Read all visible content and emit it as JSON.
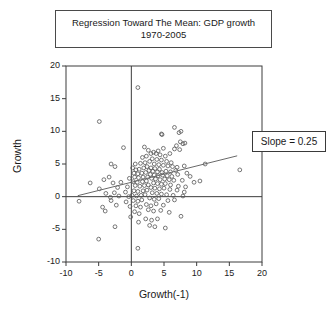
{
  "title": {
    "line1": "Regression Toward The Mean: GDP growth",
    "line2": "1970-2005"
  },
  "annotation": {
    "slope_label": "Slope = 0.25"
  },
  "axis": {
    "xlabel": "Growth(-1)",
    "ylabel": "Growth",
    "xticks": [
      "-10",
      "-5",
      "0",
      "5",
      "10",
      "15",
      "20"
    ],
    "yticks": [
      "20",
      "15",
      "10",
      "5",
      "0",
      "-5",
      "-10"
    ]
  },
  "chart_data": {
    "type": "scatter",
    "title": "Regression Toward The Mean: GDP growth 1970-2005",
    "xlabel": "Growth(-1)",
    "ylabel": "Growth",
    "xlim": [
      -10,
      20
    ],
    "ylim": [
      -10,
      20
    ],
    "xticks": [
      -10,
      -5,
      0,
      5,
      10,
      15,
      20
    ],
    "yticks": [
      -10,
      -5,
      0,
      5,
      10,
      15,
      20
    ],
    "grid": false,
    "legend": null,
    "marker": "open-circle",
    "marker_color": "#555555",
    "reference_lines": [
      {
        "name": "x-zero-line",
        "type": "vertical",
        "value": 0
      },
      {
        "name": "y-zero-line",
        "type": "horizontal",
        "value": 0
      }
    ],
    "fit_line": {
      "name": "regression-line",
      "slope": 0.25,
      "intercept": 2.2,
      "x_start": -8.2,
      "x_end": 16.2,
      "label": "Slope = 0.25"
    },
    "points": [
      [
        1.0,
        16.7
      ],
      [
        -4.9,
        11.5
      ],
      [
        6.6,
        10.6
      ],
      [
        7.6,
        10.0
      ],
      [
        4.6,
        9.6
      ],
      [
        4.7,
        9.5
      ],
      [
        7.3,
        9.8
      ],
      [
        7.5,
        8.4
      ],
      [
        8.2,
        8.2
      ],
      [
        7.9,
        8.1
      ],
      [
        6.9,
        7.8
      ],
      [
        7.4,
        7.2
      ],
      [
        6.6,
        7.3
      ],
      [
        4.9,
        7.4
      ],
      [
        4.1,
        7.0
      ],
      [
        2.6,
        7.1
      ],
      [
        2.0,
        7.6
      ],
      [
        -1.2,
        7.5
      ],
      [
        3.0,
        6.6
      ],
      [
        3.4,
        6.8
      ],
      [
        3.8,
        6.6
      ],
      [
        4.4,
        6.4
      ],
      [
        5.2,
        6.2
      ],
      [
        5.9,
        6.6
      ],
      [
        2.3,
        6.2
      ],
      [
        1.7,
        6.0
      ],
      [
        3.2,
        5.8
      ],
      [
        3.9,
        5.7
      ],
      [
        4.6,
        5.6
      ],
      [
        5.4,
        5.4
      ],
      [
        6.1,
        5.2
      ],
      [
        2.8,
        5.4
      ],
      [
        2.1,
        5.2
      ],
      [
        1.4,
        5.1
      ],
      [
        0.6,
        5.0
      ],
      [
        -3.1,
        5.0
      ],
      [
        -2.5,
        4.6
      ],
      [
        3.5,
        5.0
      ],
      [
        4.2,
        4.9
      ],
      [
        4.9,
        4.8
      ],
      [
        5.6,
        4.7
      ],
      [
        6.3,
        4.6
      ],
      [
        7.0,
        4.5
      ],
      [
        8.1,
        4.7
      ],
      [
        11.3,
        5.0
      ],
      [
        16.6,
        4.1
      ],
      [
        2.4,
        4.6
      ],
      [
        3.0,
        4.4
      ],
      [
        3.6,
        4.3
      ],
      [
        4.3,
        4.2
      ],
      [
        1.9,
        4.4
      ],
      [
        1.2,
        4.2
      ],
      [
        0.7,
        4.1
      ],
      [
        0.2,
        4.4
      ],
      [
        2.7,
        4.0
      ],
      [
        3.3,
        3.9
      ],
      [
        4.0,
        3.8
      ],
      [
        4.7,
        3.7
      ],
      [
        5.3,
        3.9
      ],
      [
        6.0,
        3.8
      ],
      [
        6.8,
        4.0
      ],
      [
        8.5,
        3.6
      ],
      [
        2.2,
        3.7
      ],
      [
        1.6,
        3.6
      ],
      [
        1.0,
        3.5
      ],
      [
        0.4,
        3.6
      ],
      [
        2.9,
        3.4
      ],
      [
        3.5,
        3.3
      ],
      [
        4.1,
        3.2
      ],
      [
        4.8,
        3.3
      ],
      [
        5.5,
        3.2
      ],
      [
        6.2,
        3.1
      ],
      [
        7.1,
        3.4
      ],
      [
        9.0,
        3.1
      ],
      [
        10.5,
        2.4
      ],
      [
        2.5,
        3.0
      ],
      [
        1.8,
        3.0
      ],
      [
        1.1,
        2.9
      ],
      [
        0.5,
        3.0
      ],
      [
        -0.3,
        2.8
      ],
      [
        -3.4,
        3.0
      ],
      [
        -6.3,
        2.1
      ],
      [
        -4.2,
        2.6
      ],
      [
        3.1,
        2.8
      ],
      [
        3.7,
        2.7
      ],
      [
        4.4,
        2.6
      ],
      [
        5.1,
        2.7
      ],
      [
        5.8,
        2.6
      ],
      [
        6.5,
        2.5
      ],
      [
        7.8,
        2.5
      ],
      [
        9.6,
        2.2
      ],
      [
        2.3,
        2.4
      ],
      [
        1.7,
        2.3
      ],
      [
        0.9,
        2.2
      ],
      [
        0.3,
        2.3
      ],
      [
        -1.6,
        2.2
      ],
      [
        -2.8,
        2.1
      ],
      [
        -4.9,
        1.2
      ],
      [
        3.4,
        2.1
      ],
      [
        4.0,
        2.0
      ],
      [
        4.6,
        1.9
      ],
      [
        5.2,
        2.0
      ],
      [
        6.0,
        1.8
      ],
      [
        7.2,
        1.6
      ],
      [
        8.3,
        1.5
      ],
      [
        2.6,
        1.8
      ],
      [
        2.0,
        1.7
      ],
      [
        1.3,
        1.6
      ],
      [
        0.6,
        1.7
      ],
      [
        -0.6,
        1.5
      ],
      [
        -2.1,
        1.4
      ],
      [
        3.0,
        1.4
      ],
      [
        3.6,
        1.3
      ],
      [
        4.3,
        1.2
      ],
      [
        5.0,
        1.3
      ],
      [
        5.9,
        1.1
      ],
      [
        7.0,
        1.0
      ],
      [
        8.1,
        0.7
      ],
      [
        2.4,
        1.0
      ],
      [
        1.8,
        0.9
      ],
      [
        1.0,
        0.8
      ],
      [
        0.4,
        0.9
      ],
      [
        -0.9,
        0.7
      ],
      [
        -2.6,
        0.6
      ],
      [
        -3.9,
        0.5
      ],
      [
        3.2,
        0.6
      ],
      [
        3.9,
        0.5
      ],
      [
        4.6,
        0.4
      ],
      [
        5.4,
        0.3
      ],
      [
        6.4,
        0.2
      ],
      [
        7.9,
        0.1
      ],
      [
        2.1,
        0.3
      ],
      [
        1.5,
        0.2
      ],
      [
        0.8,
        0.1
      ],
      [
        0.1,
        0.2
      ],
      [
        -0.4,
        0.0
      ],
      [
        -1.9,
        0.1
      ],
      [
        -3.2,
        -0.1
      ],
      [
        -8.0,
        -0.7
      ],
      [
        2.8,
        -0.2
      ],
      [
        3.5,
        -0.4
      ],
      [
        4.2,
        -0.3
      ],
      [
        5.6,
        -0.6
      ],
      [
        6.6,
        -0.5
      ],
      [
        1.6,
        -0.5
      ],
      [
        1.0,
        -0.7
      ],
      [
        0.3,
        -0.6
      ],
      [
        -0.8,
        -0.8
      ],
      [
        -2.3,
        -1.3
      ],
      [
        -3.1,
        -0.6
      ],
      [
        -4.4,
        -1.6
      ],
      [
        -4.0,
        -2.2
      ],
      [
        2.3,
        -1.2
      ],
      [
        3.0,
        -1.4
      ],
      [
        3.8,
        -1.1
      ],
      [
        4.9,
        -1.3
      ],
      [
        1.4,
        -1.6
      ],
      [
        0.7,
        -1.4
      ],
      [
        -0.2,
        -1.5
      ],
      [
        2.6,
        -2.0
      ],
      [
        3.4,
        -2.2
      ],
      [
        4.5,
        -2.1
      ],
      [
        5.8,
        -2.4
      ],
      [
        7.6,
        -3.0
      ],
      [
        1.2,
        -2.6
      ],
      [
        0.5,
        -2.3
      ],
      [
        -0.1,
        -3.1
      ],
      [
        2.2,
        -3.4
      ],
      [
        3.1,
        -3.6
      ],
      [
        4.0,
        -3.4
      ],
      [
        1.1,
        -3.9
      ],
      [
        2.8,
        -4.4
      ],
      [
        3.6,
        -4.6
      ],
      [
        5.2,
        -4.8
      ],
      [
        -2.5,
        -4.6
      ],
      [
        -5.0,
        -6.5
      ],
      [
        1.0,
        -7.9
      ]
    ]
  }
}
